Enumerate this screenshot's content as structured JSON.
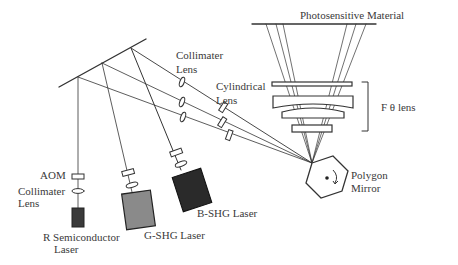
{
  "diagram": {
    "labels": {
      "photosensitive_material": "Photosensitive  Material",
      "collimater_lens_top_line1": "Collimater",
      "collimater_lens_top_line2": "Lens",
      "cylindrical_lens_line1": "Cylindrical",
      "cylindrical_lens_line2": "Lens",
      "f_theta_lens": "F θ lens",
      "polygon_mirror_line1": "Polygon",
      "polygon_mirror_line2": "Mirror",
      "aom": "AOM",
      "collimater_lens_left_line1": "Collimater",
      "collimater_lens_left_line2": "Lens",
      "r_laser_line1": "R Semiconductor",
      "r_laser_line2": "Laser",
      "g_laser": "G-SHG Laser",
      "b_laser": "B-SHG  Laser"
    },
    "components": [
      {
        "id": "fold-mirror",
        "type": "mirror"
      },
      {
        "id": "r-semiconductor-laser",
        "type": "laser",
        "color": "#3a3a3a"
      },
      {
        "id": "g-shg-laser",
        "type": "laser",
        "color": "#8a8a8a"
      },
      {
        "id": "b-shg-laser",
        "type": "laser",
        "color": "#2a2a2a"
      },
      {
        "id": "aom",
        "type": "modulator"
      },
      {
        "id": "collimater-lenses",
        "type": "lens",
        "count": 6
      },
      {
        "id": "cylindrical-lenses",
        "type": "lens",
        "count": 3
      },
      {
        "id": "polygon-mirror",
        "type": "rotating-mirror",
        "sides": 6
      },
      {
        "id": "f-theta-lens",
        "type": "lens-group",
        "elements": 4
      },
      {
        "id": "photosensitive-material",
        "type": "target-plane"
      }
    ],
    "colors": {
      "line": "#333333",
      "r_laser_fill": "#3a3a3a",
      "g_laser_fill": "#8a8a8a",
      "b_laser_fill": "#2a2a2a"
    }
  }
}
